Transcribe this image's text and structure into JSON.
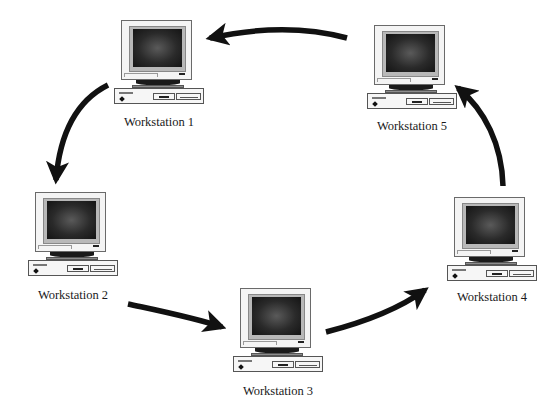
{
  "diagram": {
    "type": "ring-network",
    "direction": "clockwise",
    "arrow_color": "#111111",
    "nodes": [
      {
        "id": "ws1",
        "label": "Workstation 1",
        "icon": "desktop-computer-icon"
      },
      {
        "id": "ws2",
        "label": "Workstation 2",
        "icon": "desktop-computer-icon"
      },
      {
        "id": "ws3",
        "label": "Workstation 3",
        "icon": "desktop-computer-icon"
      },
      {
        "id": "ws4",
        "label": "Workstation 4",
        "icon": "desktop-computer-icon"
      },
      {
        "id": "ws5",
        "label": "Workstation 5",
        "icon": "desktop-computer-icon"
      }
    ],
    "edges": [
      {
        "from": "ws1",
        "to": "ws2"
      },
      {
        "from": "ws2",
        "to": "ws3"
      },
      {
        "from": "ws3",
        "to": "ws4"
      },
      {
        "from": "ws4",
        "to": "ws5"
      },
      {
        "from": "ws5",
        "to": "ws1"
      }
    ]
  }
}
